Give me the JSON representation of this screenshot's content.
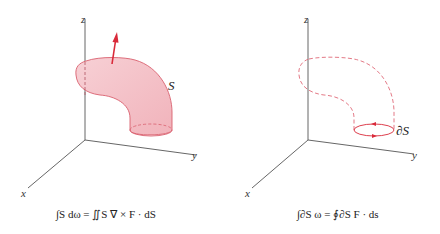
{
  "colors": {
    "surface_fill": "#f5c6cc",
    "surface_stroke": "#d9606e",
    "arrow": "#d92a3a",
    "axis": "#555555"
  },
  "left_panel": {
    "axes": {
      "x": "x",
      "y": "y",
      "z": "z"
    },
    "surface_label": "S",
    "normal_vector": "red arrow normal to surface",
    "formula": "∫S dω = ∬S ∇ × F · dS"
  },
  "right_panel": {
    "axes": {
      "x": "x",
      "y": "y",
      "z": "z"
    },
    "boundary_label": "∂S",
    "formula": "∫∂S ω = ∮∂S F · ds"
  }
}
